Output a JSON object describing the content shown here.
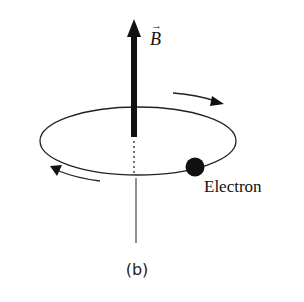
{
  "diagram": {
    "field_label": "B",
    "field_vector_arrow": "→",
    "particle_label": "Electron",
    "panel_label": "(b)",
    "colors": {
      "ink": "#111111",
      "background": "#ffffff"
    },
    "elements": {
      "field_arrow": "magnetic-field-vector",
      "orbit": "circular-orbit-ellipse",
      "rotation_arrows": [
        "clockwise-top-right",
        "clockwise-bottom-left"
      ],
      "particle": "electron-dot"
    }
  }
}
